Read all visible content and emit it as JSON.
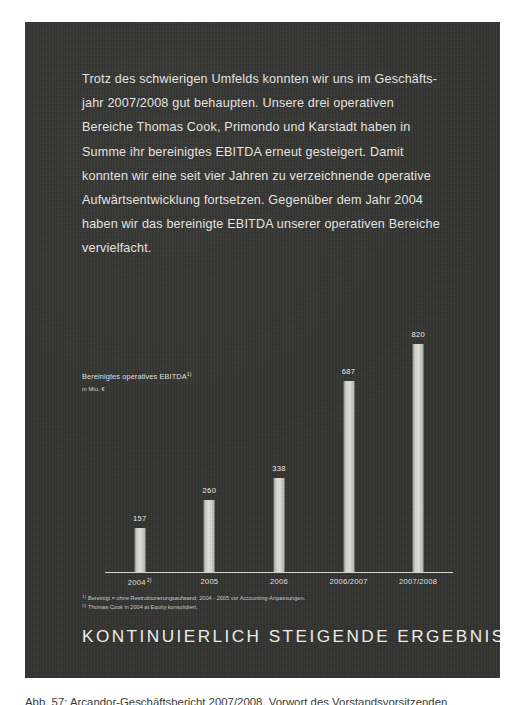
{
  "page": {
    "background_color": "#ffffff",
    "panel_color": "#333331",
    "text_color": "#e9e9e6"
  },
  "intro": {
    "paragraph": "Trotz des schwierigen Umfelds konnten wir uns im Geschäfts-\njahr 2007/2008 gut behaupten. Unsere drei operativen\nBereiche Thomas Cook, Primondo und Karstadt haben in\nSumme ihr bereinigtes EBITDA erneut gesteigert. Damit\nkonnten wir eine seit vier Jahren zu verzeichnende operative\nAufwärtsentwicklung fortsetzen. Gegenüber dem Jahr 2004\nhaben wir das bereinigte EBITDA unserer operativen Bereiche\nvervielfacht."
  },
  "chart_caption": {
    "title": "Bereinigtes operatives EBITDA",
    "title_superscript": "1)",
    "unit": "in Mio. €"
  },
  "chart_data": {
    "type": "bar",
    "title": "Bereinigtes operatives EBITDA",
    "subtitle": "in Mio. €",
    "xlabel": "",
    "ylabel": "in Mio. €",
    "categories": [
      "2004",
      "2005",
      "2006",
      "2006/2007",
      "2007/2008"
    ],
    "category_labels": [
      "2004",
      "2005",
      "2006",
      "2006/2007",
      "2007/2008"
    ],
    "category_superscripts": [
      "2)",
      "",
      "",
      "",
      ""
    ],
    "values": [
      157,
      260,
      338,
      687,
      820
    ],
    "value_labels": [
      "157",
      "260",
      "338",
      "687",
      "820"
    ],
    "ylim": [
      0,
      900
    ],
    "grid": false,
    "legend": "none",
    "bar_color": "#d8d8d4",
    "axis_color": "#d8d8d4"
  },
  "footnotes": [
    {
      "marker": "1)",
      "text": "Bereinigt = ohne Restrukturierungsaufwand; 2004 - 2005 vor Accounting-Anpassungen."
    },
    {
      "marker": "2)",
      "text": "Thomas Cook in 2004 at Equity konsolidiert."
    }
  ],
  "headline": {
    "text": "KONTINUIERLICH STEIGENDE ERGEBNISSE"
  },
  "page_caption": {
    "text": "Abb. 57: Arcandor-Geschäftsbericht 2007/2008, Vorwort des Vorstandsvorsitzenden"
  }
}
